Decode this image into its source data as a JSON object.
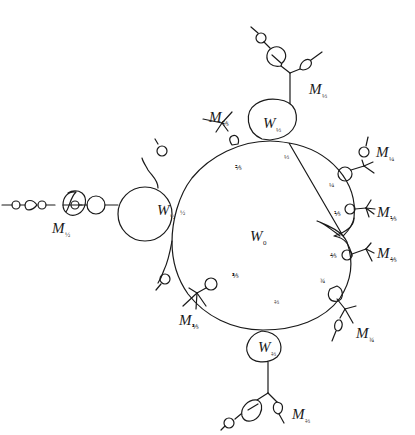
{
  "diagram": {
    "title": "",
    "main_component": {
      "label": "W",
      "sub": "0"
    },
    "bulbs": [
      {
        "id": "w-half",
        "label": "W",
        "sub": "½"
      },
      {
        "id": "w-third",
        "label": "W",
        "sub": "⅓"
      },
      {
        "id": "w-twothirds",
        "label": "W",
        "sub": "⅔"
      }
    ],
    "limb_labels": [
      {
        "id": "m-half",
        "label": "M",
        "sub": "½"
      },
      {
        "id": "m-third",
        "label": "M",
        "sub": "⅓"
      },
      {
        "id": "m-twothirds",
        "label": "M",
        "sub": "⅔"
      },
      {
        "id": "m-quarter",
        "label": "M",
        "sub": "¼"
      },
      {
        "id": "m-threequarters",
        "label": "M",
        "sub": "¾"
      },
      {
        "id": "m-fifth",
        "label": "M",
        "sub": "⅕"
      },
      {
        "id": "m-fourfifths",
        "label": "M",
        "sub": "⅘"
      },
      {
        "id": "m-twofifths",
        "label": "M",
        "sub": "⅖"
      },
      {
        "id": "m-threefifths",
        "label": "M",
        "sub": "⅗"
      }
    ],
    "boundary_fractions": [
      {
        "id": "f-third",
        "text": "⅓"
      },
      {
        "id": "f-twofifths",
        "text": "⅖"
      },
      {
        "id": "f-half",
        "text": "½"
      },
      {
        "id": "f-threefifths",
        "text": "⅗"
      },
      {
        "id": "f-twothirds",
        "text": "⅔"
      },
      {
        "id": "f-threequarters",
        "text": "¾"
      },
      {
        "id": "f-fourfifths",
        "text": "⅘"
      },
      {
        "id": "f-fifth",
        "text": "⅕"
      },
      {
        "id": "f-quarter",
        "text": "¼"
      }
    ],
    "colors": {
      "ink": "#1a1a1a",
      "background": "#ffffff"
    }
  }
}
